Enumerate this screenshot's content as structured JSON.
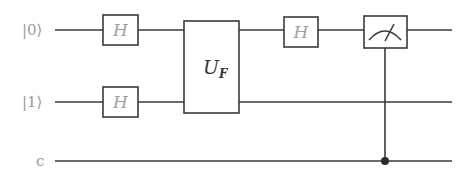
{
  "diagram": {
    "type": "quantum-circuit",
    "wires": [
      {
        "id": "q0",
        "label": "|0⟩",
        "kind": "quantum"
      },
      {
        "id": "q1",
        "label": "|1⟩",
        "kind": "quantum"
      },
      {
        "id": "c",
        "label": "c",
        "kind": "classical"
      }
    ],
    "gates": [
      {
        "id": "h1",
        "label": "H",
        "wires": [
          "q0"
        ]
      },
      {
        "id": "h2",
        "label": "H",
        "wires": [
          "q1"
        ]
      },
      {
        "id": "uf",
        "label": "U",
        "subscript": "F",
        "wires": [
          "q0",
          "q1"
        ]
      },
      {
        "id": "h3",
        "label": "H",
        "wires": [
          "q0"
        ]
      },
      {
        "id": "meas",
        "label": "measurement",
        "wires": [
          "q0"
        ],
        "target": "c"
      }
    ],
    "colors": {
      "line": "#3a3a3a",
      "label": "#9a9a9a"
    }
  }
}
